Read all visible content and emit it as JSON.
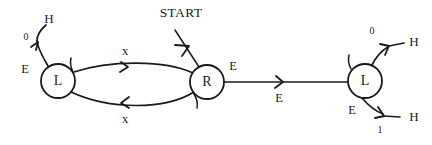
{
  "diagram": {
    "title_label": "START",
    "nodes": [
      {
        "id": "left-l",
        "label": "L",
        "cx": 58,
        "cy": 81,
        "r": 17
      },
      {
        "id": "center-r",
        "label": "R",
        "cx": 207,
        "cy": 82,
        "r": 17
      },
      {
        "id": "right-l",
        "label": "L",
        "cx": 365,
        "cy": 81,
        "r": 17
      }
    ],
    "labels": {
      "left_node": "L",
      "center_node": "R",
      "right_node": "L",
      "start": "START",
      "left_out_digit": "0",
      "left_out_terminal": "H",
      "left_out_input": "E",
      "left_paren": "(",
      "top_arc": "x",
      "bottom_arc": "x",
      "center_paren": ")",
      "center_out_input": "E",
      "link_label": "E",
      "right_paren": "(",
      "right_up_digit": "0",
      "right_up_terminal": "H",
      "right_down_input": "E",
      "right_down_digit": "1",
      "right_down_terminal": "H"
    },
    "colors": {
      "ink": "#1a1a1a",
      "background": "#ffffff"
    }
  }
}
